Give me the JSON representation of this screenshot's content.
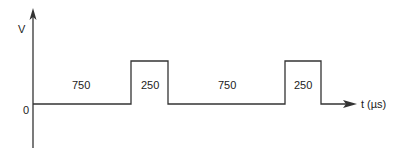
{
  "diagram": {
    "type": "pulse-waveform",
    "y_axis_label": "V",
    "x_axis_label": "t (µs)",
    "origin_label": "0",
    "segments": [
      {
        "level": "low",
        "duration_label": "750"
      },
      {
        "level": "high",
        "duration_label": "250"
      },
      {
        "level": "low",
        "duration_label": "750"
      },
      {
        "level": "high",
        "duration_label": "250"
      }
    ],
    "line_color": "#333333"
  }
}
